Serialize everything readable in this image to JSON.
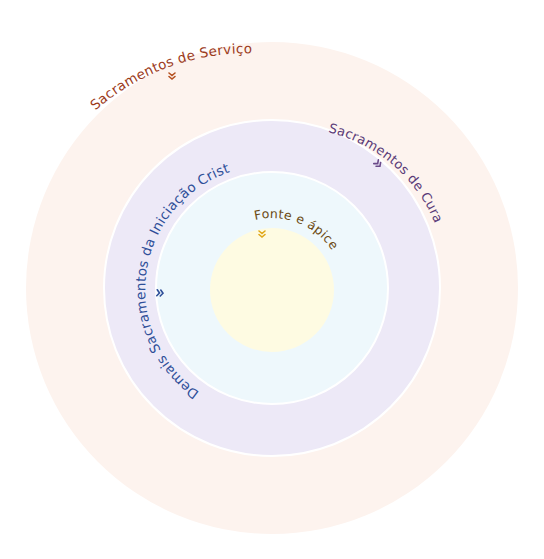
{
  "diagram": {
    "center": {
      "x": 272,
      "y": 288
    },
    "rings": [
      {
        "name": "servico",
        "radius": 246,
        "fill": "#fdf3ee"
      },
      {
        "name": "cura",
        "radius": 168,
        "fill": "#ede9f7"
      },
      {
        "name": "iniciacao",
        "radius": 116,
        "fill": "#eef8fc"
      },
      {
        "name": "fonte",
        "radius": 62,
        "fill": "#fefbe2"
      }
    ],
    "labels": {
      "servico": {
        "text": "Sacramentos de Serviço",
        "color": "#9c3b1c",
        "icon": "double-chevron-down",
        "icon_color": "#b5501f"
      },
      "cura": {
        "text": "Sacramentos de Cura",
        "color": "#5a3a78",
        "icon": "double-chevron-down",
        "icon_color": "#6b4a8a"
      },
      "iniciacao": {
        "text": "Demais Sacramentos da Iniciação Cristã",
        "color": "#2f4f99",
        "icon": "double-chevron-down",
        "icon_color": "#2f4f99"
      },
      "fonte": {
        "text": "Fonte e ápice",
        "color": "#6b4a12",
        "icon": "double-chevron-down",
        "icon_color": "#e0a81a"
      }
    }
  }
}
